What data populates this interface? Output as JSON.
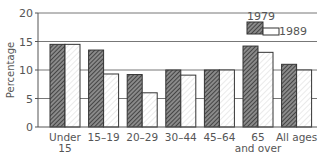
{
  "chart_data": {
    "type": "bar",
    "title": "",
    "xlabel": "",
    "ylabel": "Percentage",
    "ylim": [
      0,
      20
    ],
    "yticks": [
      0,
      5,
      10,
      15,
      20
    ],
    "grid": true,
    "legend_position": "top-right",
    "categories": [
      "Under 15",
      "15–19",
      "20–29",
      "30–44",
      "45–64",
      "65 and over",
      "All ages"
    ],
    "category_lines": [
      [
        "Under",
        "15"
      ],
      [
        "15–19"
      ],
      [
        "20–29"
      ],
      [
        "30–44"
      ],
      [
        "45–64"
      ],
      [
        "65",
        "and over"
      ],
      [
        "All ages"
      ]
    ],
    "series": [
      {
        "name": "1979",
        "values": [
          14.5,
          13.5,
          9.2,
          10.0,
          10.0,
          14.2,
          11.0
        ],
        "style": "dark-hatch"
      },
      {
        "name": "1989",
        "values": [
          14.5,
          9.3,
          6.0,
          9.1,
          10.0,
          13.1,
          10.0
        ],
        "style": "light-hatch"
      }
    ]
  },
  "colors": {
    "axis": "#555555",
    "grid": "#777777",
    "dark_fill": "#8a8a8a",
    "dark_hatch": "#333333",
    "light_fill": "#ffffff",
    "light_hatch": "#cfcfcf",
    "bar_stroke": "#333333"
  }
}
